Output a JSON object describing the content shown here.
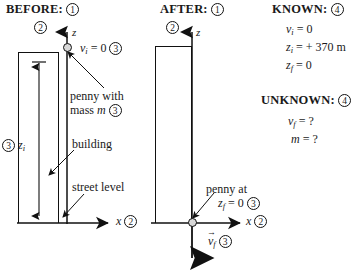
{
  "panels": {
    "before": {
      "title": "BEFORE:",
      "title_step": "1",
      "axis_step": "2",
      "z_axis_label": "z",
      "x_axis_label": "x",
      "x_axis_step": "2",
      "initial_velocity_label": "v",
      "initial_velocity_sub": "i",
      "initial_velocity_value": "= 0",
      "initial_velocity_step": "3",
      "penny_label_line1": "penny with",
      "penny_label_line2": "mass",
      "penny_mass_symbol": "m",
      "penny_label_step": "3",
      "building_label": "building",
      "street_label": "street level",
      "height_step": "3",
      "height_symbol": "z",
      "height_sub": "i"
    },
    "after": {
      "title": "AFTER:",
      "title_step": "1",
      "axis_step": "2",
      "z_axis_label": "z",
      "x_axis_label": "x",
      "x_axis_step": "2",
      "penny_label_line1": "penny at",
      "penny_final_symbol": "z",
      "penny_final_sub": "f",
      "penny_final_value": "= 0",
      "penny_final_step": "3",
      "final_velocity_symbol": "v",
      "final_velocity_sub": "f",
      "final_velocity_step": "3"
    },
    "data": {
      "known_title": "KNOWN:",
      "known_step": "4",
      "known_items": [
        {
          "symbol": "v",
          "sub": "i",
          "value": "= 0"
        },
        {
          "symbol": "z",
          "sub": "i",
          "value": "= + 370 m"
        },
        {
          "symbol": "z",
          "sub": "f",
          "value": "=  0"
        }
      ],
      "unknown_title": "UNKNOWN:",
      "unknown_step": "4",
      "unknown_items": [
        {
          "symbol": "v",
          "sub": "f",
          "value": "= ?"
        },
        {
          "symbol": "m",
          "sub": "",
          "value": "= ?"
        }
      ]
    }
  },
  "colors": {
    "ink": "#111111",
    "penny_fill": "#d8d8d8",
    "background": "#ffffff"
  }
}
